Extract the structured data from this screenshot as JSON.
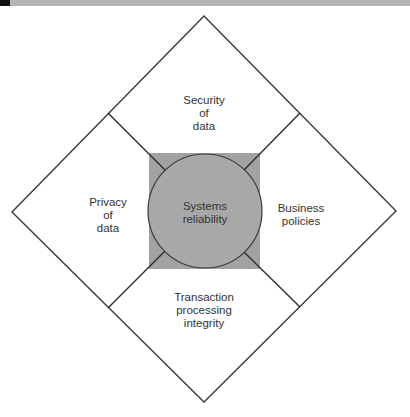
{
  "diagram": {
    "center": {
      "label": "Systems\nreliability"
    },
    "quadrants": [
      {
        "position": "top",
        "label": "Security\nof\ndata"
      },
      {
        "position": "left",
        "label": "Privacy\nof\ndata"
      },
      {
        "position": "right",
        "label": "Business\npolicies"
      },
      {
        "position": "bottom",
        "label": "Transaction\nprocessing\nintegrity"
      }
    ],
    "colors": {
      "line": "#3a3a3a",
      "square_fill": "#a2a2a2",
      "circle_fill": "#a8a8a8",
      "background": "#ffffff",
      "top_bar": "#b4b4b4"
    }
  }
}
